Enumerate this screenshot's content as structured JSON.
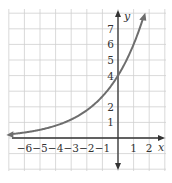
{
  "chart_data": {
    "type": "line",
    "title": "",
    "xlabel": "x",
    "ylabel": "y",
    "xlim": [
      -7,
      3
    ],
    "ylim": [
      -2,
      8
    ],
    "grid": true,
    "x_tick_labels": [
      "-6",
      "-5",
      "-4",
      "-3",
      "-2",
      "-1",
      "1",
      "2"
    ],
    "y_tick_labels": [
      "1",
      "2",
      "4",
      "5",
      "6",
      "7"
    ],
    "series": [
      {
        "name": "y = 4(1.5)^x",
        "x": [
          -7,
          -6,
          -5,
          -4,
          -3,
          -2,
          -1,
          0,
          1,
          1.6
        ],
        "values": [
          0.23,
          0.35,
          0.53,
          0.79,
          1.19,
          1.78,
          2.67,
          4,
          6,
          7.6
        ]
      }
    ],
    "colors": {
      "curve": "#6e6e6e",
      "axes": "#333333",
      "grid": "#c8c8c8"
    }
  }
}
